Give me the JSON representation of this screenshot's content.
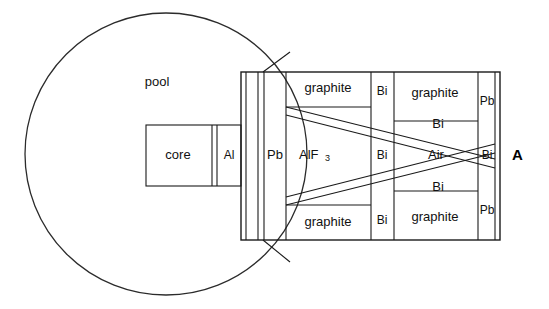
{
  "diagram": {
    "pool": {
      "label": "pool",
      "shape": "circle",
      "center_x": 166,
      "center_y": 154,
      "radius": 141
    },
    "axis_label": "A",
    "core": {
      "label": "core"
    },
    "layers_center_row": [
      {
        "label": "Al"
      },
      {
        "label": "Pb"
      },
      {
        "label": "AlF",
        "subscript": "3"
      },
      {
        "label": "Bi"
      },
      {
        "label": "Air"
      },
      {
        "label": "Bi"
      }
    ],
    "top_row": [
      {
        "label": "graphite"
      },
      {
        "label": "Bi"
      },
      {
        "label": "graphite"
      },
      {
        "label": "Pb"
      }
    ],
    "bottom_row": [
      {
        "label": "graphite"
      },
      {
        "label": "Bi"
      },
      {
        "label": "graphite"
      },
      {
        "label": "Pb"
      }
    ],
    "diagonal_bands": [
      {
        "label": "Bi",
        "orientation": "upper-sloping-down"
      },
      {
        "label": "Bi",
        "orientation": "lower-sloping-up"
      }
    ],
    "colors": {
      "line": "#1a1a1a",
      "pool_line": "#2b2b2b",
      "text": "#111111",
      "background": "#ffffff"
    }
  }
}
